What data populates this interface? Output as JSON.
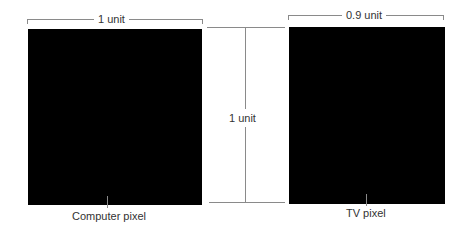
{
  "diagram": {
    "computer_pixel": {
      "width_label": "1 unit",
      "caption": "Computer pixel",
      "fill": "#000000"
    },
    "height_indicator": {
      "label": "1 unit"
    },
    "tv_pixel": {
      "width_label": "0.9 unit",
      "caption": "TV pixel",
      "fill": "#000000"
    },
    "line_color": "#8a8a8a"
  }
}
